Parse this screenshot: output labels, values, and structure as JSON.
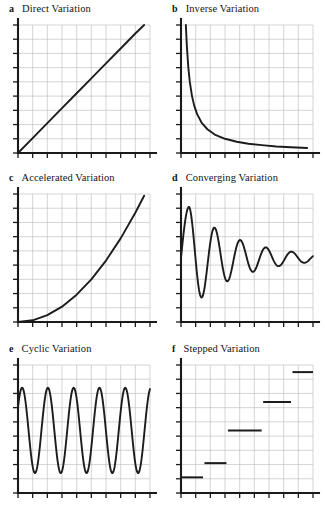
{
  "figure": {
    "background_color": "#ffffff",
    "axis_color": "#1a1a1a",
    "grid_color": "#b9b9bd",
    "curve_color": "#1c1c1c"
  },
  "panels": [
    {
      "letter": "a",
      "title": "Direct Variation",
      "chart_data": {
        "type": "line",
        "title": "Direct Variation",
        "xlabel": "",
        "ylabel": "",
        "xlim": [
          0,
          9
        ],
        "ylim": [
          0,
          9
        ],
        "grid": true,
        "legend": "none",
        "x": [
          0,
          1,
          2,
          3,
          4,
          5,
          6,
          7,
          8,
          8.6
        ],
        "y": [
          0,
          1.05,
          2.1,
          3.15,
          4.2,
          5.25,
          6.3,
          7.35,
          8.4,
          9.0
        ],
        "annotation": "straight line through origin, constant positive slope"
      }
    },
    {
      "letter": "b",
      "title": "Inverse Variation",
      "chart_data": {
        "type": "line",
        "title": "Inverse Variation",
        "xlabel": "",
        "ylabel": "",
        "xlim": [
          0,
          9
        ],
        "ylim": [
          0,
          9
        ],
        "grid": true,
        "legend": "none",
        "x": [
          0.33,
          0.4,
          0.5,
          0.6,
          0.75,
          0.9,
          1.1,
          1.4,
          1.8,
          2.3,
          3.0,
          3.8,
          4.6,
          5.5,
          6.5,
          7.5,
          8.6
        ],
        "y": [
          9.0,
          7.5,
          6.0,
          5.0,
          4.0,
          3.33,
          2.73,
          2.14,
          1.67,
          1.3,
          1.0,
          0.79,
          0.65,
          0.55,
          0.46,
          0.4,
          0.35
        ],
        "annotation": "hyperbola y = 3/x, asymptotic to both axes"
      }
    },
    {
      "letter": "c",
      "title": "Accelerated Variation",
      "chart_data": {
        "type": "line",
        "title": "Accelerated Variation",
        "xlabel": "",
        "ylabel": "",
        "xlim": [
          0,
          9
        ],
        "ylim": [
          0,
          9
        ],
        "grid": true,
        "legend": "none",
        "x": [
          0,
          1,
          2,
          3,
          4,
          5,
          6,
          7,
          8,
          8.6
        ],
        "y": [
          0,
          0.12,
          0.48,
          1.08,
          1.92,
          3.0,
          4.32,
          5.88,
          7.68,
          8.88
        ],
        "annotation": "upward curving exponential/quadratic growth y = 0.12x^2"
      }
    },
    {
      "letter": "d",
      "title": "Converging Variation",
      "chart_data": {
        "type": "line",
        "title": "Converging Variation",
        "xlabel": "",
        "ylabel": "",
        "xlim": [
          0,
          9
        ],
        "ylim": [
          0,
          9
        ],
        "grid": true,
        "legend": "none",
        "annotation": "damped oscillation converging to equilibrium y = 4.5; 5 decaying cycles",
        "equilibrium": 4.5,
        "peaks_y": [
          8.1,
          6.4,
          5.6,
          5.15,
          4.85,
          4.68
        ],
        "troughs_y": [
          1.2,
          3.0,
          3.8,
          4.15,
          4.35
        ],
        "peaks_x": [
          0.55,
          2.3,
          4.0,
          5.6,
          7.1,
          8.4
        ],
        "troughs_x": [
          1.45,
          3.15,
          4.8,
          6.35,
          7.75
        ]
      }
    },
    {
      "letter": "e",
      "title": "Cyclic Variation",
      "chart_data": {
        "type": "line",
        "title": "Cyclic Variation",
        "xlabel": "",
        "ylabel": "",
        "xlim": [
          0,
          9
        ],
        "ylim": [
          0,
          9
        ],
        "grid": true,
        "legend": "none",
        "annotation": "constant-amplitude sine wave, 5 full cycles, starts at a crest",
        "midline": 4.4,
        "amplitude": 3.0,
        "cycles": 5,
        "crest_y": 7.4,
        "trough_y": 1.4
      }
    },
    {
      "letter": "f",
      "title": "Stepped Variation",
      "chart_data": {
        "type": "line",
        "title": "Stepped Variation",
        "xlabel": "",
        "ylabel": "",
        "xlim": [
          0,
          9
        ],
        "ylim": [
          0,
          9
        ],
        "grid": true,
        "legend": "none",
        "annotation": "ascending staircase of five flat steps",
        "steps": [
          {
            "x_start": 0.0,
            "x_end": 1.5,
            "y": 1.1
          },
          {
            "x_start": 1.6,
            "x_end": 3.1,
            "y": 2.1
          },
          {
            "x_start": 3.2,
            "x_end": 5.5,
            "y": 4.4
          },
          {
            "x_start": 5.6,
            "x_end": 7.5,
            "y": 6.4
          },
          {
            "x_start": 7.6,
            "x_end": 9.0,
            "y": 8.5
          }
        ]
      }
    }
  ]
}
